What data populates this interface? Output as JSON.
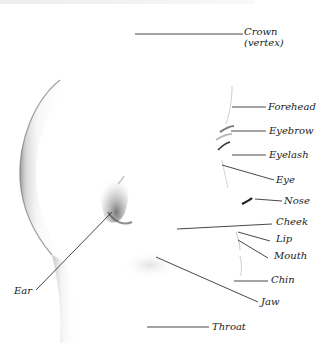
{
  "diagram": {
    "label_color": "#1a1a1a",
    "line_color": "#333333",
    "labels": [
      {
        "id": "crown",
        "text": "Crown",
        "sub": "(vertex)"
      },
      {
        "id": "forehead",
        "text": "Forehead"
      },
      {
        "id": "eyebrow",
        "text": "Eyebrow"
      },
      {
        "id": "eyelash",
        "text": "Eyelash"
      },
      {
        "id": "eye",
        "text": "Eye"
      },
      {
        "id": "nose",
        "text": "Nose"
      },
      {
        "id": "cheek",
        "text": "Cheek"
      },
      {
        "id": "lip",
        "text": "Lip"
      },
      {
        "id": "mouth",
        "text": "Mouth"
      },
      {
        "id": "chin",
        "text": "Chin"
      },
      {
        "id": "jaw",
        "text": "Jaw"
      },
      {
        "id": "throat",
        "text": "Throat"
      },
      {
        "id": "ear",
        "text": "Ear"
      }
    ]
  }
}
